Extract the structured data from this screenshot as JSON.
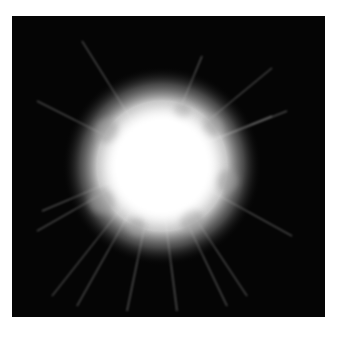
{
  "image": {
    "subject": "bright white explosion burst with radiating light streaks on black background",
    "background_color": "#050505",
    "page_color": "#ffffff",
    "core_color": "#ffffff",
    "center": {
      "x": 158,
      "y": 158
    },
    "core_radius": 60
  }
}
